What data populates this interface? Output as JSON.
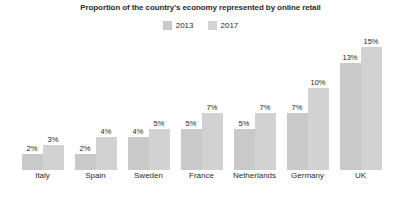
{
  "chart_data": {
    "type": "bar",
    "title": "Proportion of the country's economy represented by online retail",
    "xlabel": "",
    "ylabel": "",
    "ylim": [
      0,
      15
    ],
    "grid": false,
    "legend_position": "top-center",
    "value_label_suffix": "%",
    "categories": [
      "Italy",
      "Spain",
      "Sweden",
      "France",
      "Netherlands",
      "Germany",
      "UK"
    ],
    "series": [
      {
        "name": "2013",
        "color": "#c9c9c9",
        "values": [
          2,
          2,
          4,
          5,
          5,
          7,
          13
        ],
        "labels": [
          "2%",
          "2%",
          "4%",
          "5%",
          "5%",
          "7%",
          "13%"
        ]
      },
      {
        "name": "2017",
        "color": "#d2d2d2",
        "values": [
          3,
          4,
          5,
          7,
          7,
          10,
          15
        ],
        "labels": [
          "3%",
          "4%",
          "5%",
          "7%",
          "7%",
          "10%",
          "15%"
        ]
      }
    ]
  },
  "legend": {
    "items": [
      {
        "label": "2013",
        "color": "#c9c9c9"
      },
      {
        "label": "2017",
        "color": "#d2d2d2"
      }
    ]
  }
}
